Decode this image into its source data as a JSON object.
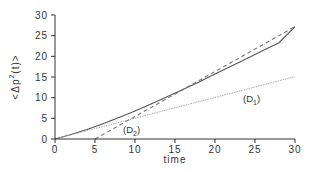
{
  "chart_data": {
    "type": "line",
    "title": "",
    "xlabel": "time",
    "ylabel": "<Δp²(t)>",
    "ylabel_parts": {
      "pre": "<Δp",
      "sup": "2",
      "post": "(t)>"
    },
    "xlim": [
      0,
      30
    ],
    "ylim": [
      0,
      30
    ],
    "xticks": [
      0,
      5,
      10,
      15,
      20,
      25,
      30
    ],
    "yticks": [
      0,
      5,
      10,
      15,
      20,
      25,
      30
    ],
    "xtick_labels": [
      "0",
      "5",
      "10",
      "15",
      "20",
      "25",
      "30"
    ],
    "ytick_labels": [
      "0",
      "5",
      "10",
      "15",
      "20",
      "25",
      "30"
    ],
    "grid": false,
    "legend": null,
    "series": [
      {
        "name": "<Δp²(t)>",
        "style": "solid",
        "color": "#555555",
        "x": [
          0,
          2,
          4,
          6,
          8,
          10,
          12,
          14,
          16,
          18,
          20,
          22,
          24,
          26,
          28,
          30
        ],
        "y": [
          0,
          1.1,
          2.3,
          3.7,
          5.2,
          6.8,
          8.5,
          10.2,
          12.0,
          13.8,
          15.7,
          17.6,
          19.5,
          21.4,
          23.3,
          27.2
        ]
      },
      {
        "name": "(D1)",
        "style": "dotted",
        "color": "#aaaaaa",
        "x": [
          0,
          30
        ],
        "y": [
          0,
          15.1
        ]
      },
      {
        "name": "(D2)",
        "style": "dashed",
        "color": "#777777",
        "x": [
          5,
          30
        ],
        "y": [
          0,
          27.2
        ]
      }
    ],
    "annotations": [
      {
        "text_main": "(D",
        "text_sub": "1",
        "text_end": ")",
        "x": 23.5,
        "y": 9.0
      },
      {
        "text_main": "(D",
        "text_sub": "2",
        "text_end": ")",
        "x": 8.5,
        "y": 1.4
      }
    ]
  }
}
